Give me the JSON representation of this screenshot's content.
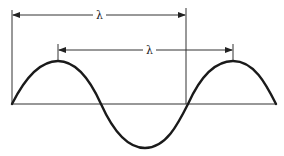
{
  "diagram": {
    "title": "",
    "type": "wavelength illustration",
    "labels": {
      "wavelength_top": "λ",
      "wavelength_peak": "λ"
    },
    "colors": {
      "line": "#222222",
      "background": "#ffffff"
    }
  }
}
